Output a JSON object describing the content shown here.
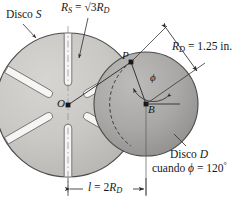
{
  "figure": {
    "colors": {
      "disc_s_fill": "#c9c8c5",
      "disc_d_fill": "#a9a8a6",
      "slot_fill": "#f4f3f1",
      "outline": "#3a3a3c",
      "text": "#17171a",
      "background": "#ffffff"
    }
  },
  "labels": {
    "disco_s": "Disco S",
    "disco_s_name": "Disco",
    "disco_s_letter": "S",
    "rs_prefix": "R",
    "rs_sub": "S",
    "rs_equals": " = ",
    "rs_value": "√3",
    "rs_rd": "R",
    "rs_rd_sub": "D",
    "rd_prefix": "R",
    "rd_sub": "D",
    "rd_equals": " = 1.25 in.",
    "point_p": "P",
    "point_o": "O",
    "point_b": "B",
    "phi": "ϕ",
    "disco_d_name": "Disco",
    "disco_d_letter": "D",
    "cuando_text": "cuando ",
    "cuando_phi": "ϕ",
    "cuando_equals": " = 120",
    "cuando_degree": "°",
    "l_prefix": "l",
    "l_equals": " = 2",
    "l_rd": "R",
    "l_rd_sub": "D"
  },
  "geometry": {
    "disc_s_center": [
      68,
      105
    ],
    "disc_s_radius": 72,
    "disc_d_center": [
      146,
      104
    ],
    "disc_d_radius": 52,
    "point_p": [
      131,
      62
    ],
    "slot_count": 6,
    "phi_degrees": 120,
    "rd_inches": 1.25,
    "l_relation": "2R_D",
    "rs_relation": "sqrt(3) R_D"
  }
}
